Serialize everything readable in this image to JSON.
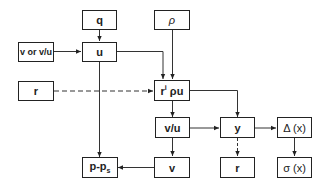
{
  "diagram": {
    "type": "flowchart",
    "nodes": [
      {
        "id": "q",
        "label": "q"
      },
      {
        "id": "rho",
        "label": "ρ"
      },
      {
        "id": "v_or_vu",
        "label": "v or v/u"
      },
      {
        "id": "u",
        "label": "u"
      },
      {
        "id": "r_left",
        "label": "r"
      },
      {
        "id": "ri_rho_u",
        "label_base": "r",
        "label_sup": "i",
        "label_rest": " ρu"
      },
      {
        "id": "vu",
        "label": "v/u"
      },
      {
        "id": "y",
        "label": "y"
      },
      {
        "id": "delta_x",
        "label": "Δ (x)"
      },
      {
        "id": "p_ps",
        "label_base": "p-p",
        "label_sub": "s"
      },
      {
        "id": "v",
        "label": "v"
      },
      {
        "id": "r_bottom",
        "label": "r"
      },
      {
        "id": "sigma_x",
        "label": "σ (x)"
      }
    ],
    "edges": [
      {
        "from": "q",
        "to": "u",
        "style": "solid"
      },
      {
        "from": "v_or_vu",
        "to": "u",
        "style": "solid"
      },
      {
        "from": "u",
        "to": "ri_rho_u",
        "style": "solid"
      },
      {
        "from": "rho",
        "to": "ri_rho_u",
        "style": "solid"
      },
      {
        "from": "r_left",
        "to": "ri_rho_u",
        "style": "dashed"
      },
      {
        "from": "u",
        "to": "p_ps",
        "style": "solid"
      },
      {
        "from": "ri_rho_u",
        "to": "vu",
        "style": "solid"
      },
      {
        "from": "ri_rho_u",
        "to": "y",
        "style": "solid"
      },
      {
        "from": "vu",
        "to": "y",
        "style": "solid"
      },
      {
        "from": "vu",
        "to": "v",
        "style": "solid"
      },
      {
        "from": "v",
        "to": "p_ps",
        "style": "solid"
      },
      {
        "from": "y",
        "to": "delta_x",
        "style": "solid"
      },
      {
        "from": "y",
        "to": "r_bottom",
        "style": "dashed"
      },
      {
        "from": "delta_x",
        "to": "sigma_x",
        "style": "solid"
      }
    ]
  }
}
